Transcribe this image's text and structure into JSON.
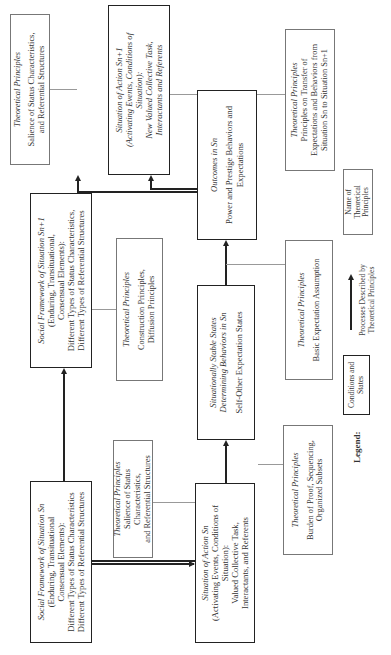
{
  "boxes": {
    "social_framework_n": {
      "title": "Social Framework of Situation Sn",
      "lines": [
        "(Enduring, Transituational",
        "Consensual Elements):",
        "Different Types of Status Characteristics",
        "Different Types of Referential Structures"
      ]
    },
    "tp_salience_bottom": {
      "heading": "Theoretical Principles",
      "lines": [
        "Salience of Status Characteristics,",
        "and Referential Structures"
      ]
    },
    "situation_action_n": {
      "title": "Situation of Action Sn",
      "lines": [
        "(Activating Events, Conditions of",
        "Situation):",
        "Valued Collective Task,",
        "Interactants, and Referents"
      ]
    },
    "tp_burden": {
      "heading": "Theoretical Principles",
      "lines": [
        "Burden of Proof, Sequencing,",
        "Organized Subsets"
      ]
    },
    "social_framework_n1": {
      "title": "Social Framework of Situation Sn+1",
      "lines": [
        "(Enduring, Transituational,",
        "Consensual Elements):",
        "Different Types of Status Characteristics,",
        "Different Types of Referential Structures"
      ]
    },
    "tp_construction": {
      "heading": "Theoretical Principles",
      "lines": [
        "Construction Principles,",
        "Diffusion Principles"
      ]
    },
    "stable_states": {
      "title_lines": [
        "Situationally Stable States",
        "Determining Behaviors in Sn"
      ],
      "lines": [
        "Self-Other Expectation States"
      ]
    },
    "tp_basic_expectation": {
      "heading": "Theoretical Principles",
      "lines": [
        "Basic Expectation Assumption"
      ]
    },
    "outcomes_n": {
      "title": "Outcomes in Sn",
      "lines": [
        "Power and Prestige Behaviors and",
        "Expectations"
      ]
    },
    "tp_salience_top": {
      "heading": "Theoretical Principles",
      "lines": [
        "Salience of Status Characteristics,",
        "and Referential Structures"
      ]
    },
    "situation_action_n1": {
      "title_lines": [
        "Situation of Action Sn+1",
        "(Activating Events, Conditions of",
        "Situation):",
        "New Valued Collective Task,",
        "Interactants and Referents"
      ]
    },
    "tp_transfer": {
      "heading": "Theoretical Principles",
      "lines": [
        "Principles on Transfer of",
        "Expectations and Behaviors from",
        "Situation Sn to Situation Sn+1"
      ]
    }
  },
  "legend": {
    "label": "Legend:",
    "conditions_lines": [
      "Conditions and",
      "States"
    ],
    "processes_lines": [
      "Processes Described by",
      "Theoretical Principles"
    ],
    "name_lines": [
      "Name of",
      "Theoretical Principles"
    ]
  }
}
